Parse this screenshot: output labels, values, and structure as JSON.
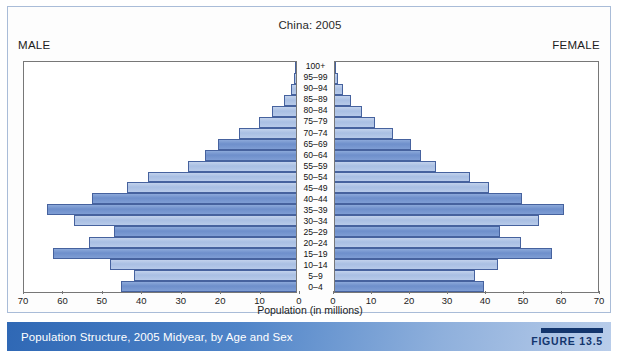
{
  "figure": {
    "title": "China: 2005",
    "male_label": "MALE",
    "female_label": "FEMALE",
    "axis_title": "Population (in millions)",
    "caption": "Population Structure, 2005 Midyear, by Age and Sex",
    "figure_number": "FIGURE 13.5",
    "colors": {
      "bar_dark": "#7e9dd4",
      "bar_light": "#b7cae9",
      "bar_border": "#46629e",
      "caption_bar_start": "#2f68b5",
      "caption_bar_end": "#b9cdea",
      "figure_tag": "#13356d",
      "panel_border": "#777777",
      "card_border": "#a9bcd8"
    }
  },
  "chart_data": {
    "type": "bar",
    "title": "China: 2005",
    "subtitle": "Population Structure, 2005 Midyear, by Age and Sex",
    "xlabel": "Population (in millions)",
    "ylabel": "Age group",
    "orientation": "horizontal",
    "layout": "population-pyramid",
    "grid": false,
    "legend_position": "none",
    "xlim_left": [
      70,
      0
    ],
    "xlim_right": [
      0,
      70
    ],
    "xticks_left": [
      70,
      60,
      50,
      40,
      30,
      20,
      10,
      0
    ],
    "xticks_right": [
      0,
      10,
      20,
      30,
      40,
      50,
      60,
      70
    ],
    "categories": [
      "100+",
      "95–99",
      "90–94",
      "85–89",
      "80–84",
      "75–79",
      "70–74",
      "65–69",
      "60–64",
      "55–59",
      "50–54",
      "45–49",
      "40–44",
      "35–39",
      "30–34",
      "25–29",
      "20–24",
      "15–19",
      "10–14",
      "5–9",
      "0–4"
    ],
    "series": [
      {
        "name": "MALE",
        "side": "left",
        "values": [
          0.1,
          0.4,
          1.3,
          3.2,
          6.1,
          9.4,
          14.6,
          20.0,
          23.5,
          27.9,
          38.0,
          43.5,
          52.5,
          64.0,
          57.2,
          46.8,
          53.4,
          62.5,
          47.9,
          41.8,
          45.0
        ]
      },
      {
        "name": "FEMALE",
        "side": "right",
        "values": [
          0.2,
          0.7,
          2.0,
          4.2,
          7.3,
          10.6,
          15.4,
          20.3,
          23.0,
          26.8,
          35.9,
          41.0,
          49.8,
          61.0,
          54.3,
          44.0,
          49.5,
          57.7,
          43.4,
          37.3,
          39.6
        ]
      }
    ],
    "bar_shade_pattern": [
      "light",
      "light",
      "light",
      "light",
      "light",
      "light",
      "light",
      "dark",
      "dark",
      "light",
      "light",
      "light",
      "dark",
      "dark",
      "light",
      "dark",
      "light",
      "dark",
      "light",
      "light",
      "dark"
    ]
  }
}
